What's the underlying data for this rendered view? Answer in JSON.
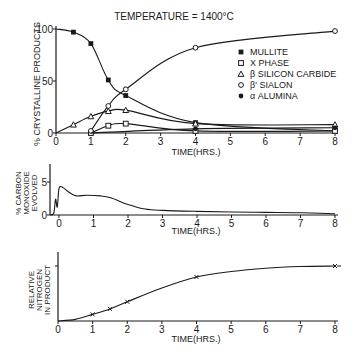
{
  "chart_data": [
    {
      "type": "line",
      "title": "TEMPERATURE = 1400°C",
      "xlabel": "TIME(HRS.)",
      "ylabel": "% CRYSTALLINE PRODUCTS",
      "xlim": [
        0,
        8
      ],
      "ylim": [
        0,
        100
      ],
      "x_ticks": [
        0,
        1,
        2,
        3,
        4,
        5,
        6,
        7,
        8
      ],
      "y_ticks": [
        0,
        50,
        100
      ],
      "grid": false,
      "legend_position": "right-middle",
      "series": [
        {
          "name": "MULLITE",
          "marker": "filled-square",
          "points": [
            [
              0,
              100
            ],
            [
              0.5,
              97
            ],
            [
              1,
              86
            ],
            [
              1.5,
              51
            ],
            [
              2,
              36
            ],
            [
              4,
              10
            ],
            [
              8,
              2
            ]
          ]
        },
        {
          "name": "X PHASE",
          "marker": "open-square",
          "points": [
            [
              1,
              0
            ],
            [
              1.5,
              7
            ],
            [
              2,
              9
            ],
            [
              4,
              2
            ],
            [
              8,
              2
            ]
          ]
        },
        {
          "name": "β SILICON CARBIDE",
          "marker": "triangle",
          "points": [
            [
              0,
              0
            ],
            [
              0.5,
              8
            ],
            [
              1,
              16
            ],
            [
              1.5,
              21
            ],
            [
              2,
              22
            ],
            [
              4,
              9
            ],
            [
              8,
              8
            ]
          ]
        },
        {
          "name": "β' SIALON",
          "marker": "open-circle",
          "points": [
            [
              1,
              2
            ],
            [
              1.5,
              26
            ],
            [
              2,
              42
            ],
            [
              4,
              82
            ],
            [
              8,
              98
            ]
          ]
        },
        {
          "name": "α ALUMINA",
          "marker": "filled-circle",
          "points": [
            [
              1,
              0
            ],
            [
              4,
              4
            ],
            [
              8,
              5
            ]
          ]
        }
      ]
    },
    {
      "type": "line",
      "title": "",
      "xlabel": "TIME(HRS.)",
      "ylabel": "% CARBON MONOXIDE EVOLVED",
      "xlim": [
        -0.25,
        8
      ],
      "ylim": [
        0,
        5
      ],
      "x_ticks": [
        0,
        1,
        2,
        3,
        4,
        5,
        6,
        7,
        8
      ],
      "y_ticks": [
        0,
        5
      ],
      "grid": false,
      "series": [
        {
          "name": "CO evolved",
          "points": [
            [
              -0.25,
              0
            ],
            [
              -0.15,
              0.3
            ],
            [
              -0.1,
              2.4
            ],
            [
              -0.05,
              1.2
            ],
            [
              0,
              4.0
            ],
            [
              0.1,
              4.2
            ],
            [
              0.3,
              3.4
            ],
            [
              0.5,
              2.9
            ],
            [
              0.8,
              3.0
            ],
            [
              1.2,
              2.9
            ],
            [
              1.5,
              2.6
            ],
            [
              2,
              1.6
            ],
            [
              2.5,
              0.9
            ],
            [
              3,
              0.7
            ],
            [
              4,
              0.55
            ],
            [
              5,
              0.45
            ],
            [
              6,
              0.4
            ],
            [
              7,
              0.35
            ],
            [
              8,
              0.2
            ]
          ]
        }
      ]
    },
    {
      "type": "line",
      "title": "",
      "xlabel": "TIME(HRS.)",
      "ylabel": "RELATIVE NITROGEN IN PRODUCT",
      "xlim": [
        0,
        8
      ],
      "ylim": [
        0,
        1
      ],
      "x_ticks": [
        0,
        1,
        2,
        3,
        4,
        5,
        6,
        7,
        8
      ],
      "y_ticks": [
        1
      ],
      "grid": false,
      "series": [
        {
          "name": "Relative nitrogen",
          "marker": "x",
          "points": [
            [
              0,
              0
            ],
            [
              0.5,
              0.03
            ],
            [
              1,
              0.12
            ],
            [
              1.5,
              0.22
            ],
            [
              2,
              0.35
            ],
            [
              3,
              0.6
            ],
            [
              4,
              0.8
            ],
            [
              5,
              0.9
            ],
            [
              6,
              0.96
            ],
            [
              7,
              0.99
            ],
            [
              8,
              1.0
            ]
          ]
        }
      ]
    }
  ],
  "labels": {
    "title": "TEMPERATURE = 1400°C",
    "top_ylabel": "% CRYSTALLINE PRODUCTS",
    "mid_ylabel_1": "% CARBON",
    "mid_ylabel_2": "MONOXIDE",
    "mid_ylabel_3": "EVOLVED",
    "bot_ylabel_1": "RELATIVE",
    "bot_ylabel_2": "NITROGEN",
    "bot_ylabel_3": "IN PRODUCT",
    "xlabel": "TIME(HRS.)"
  },
  "legend": [
    {
      "label": "MULLITE",
      "marker": "filled-square"
    },
    {
      "label": "X PHASE",
      "marker": "open-square"
    },
    {
      "label": "β SILICON CARBIDE",
      "marker": "triangle"
    },
    {
      "label": "β' SIALON",
      "marker": "open-circle"
    },
    {
      "label": "α ALUMINA",
      "marker": "filled-circle"
    }
  ],
  "colors": {
    "ink": "#1a1a1a",
    "background": "#ffffff"
  }
}
